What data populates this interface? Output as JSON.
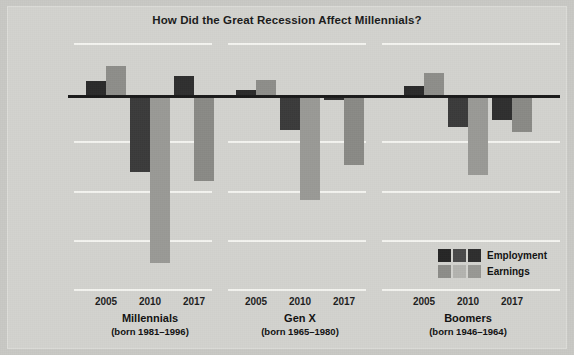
{
  "chart_data": {
    "type": "bar",
    "title": "How Did the Great Recession Affect Millennials?",
    "xlabel": "",
    "ylabel": "Difference from average level",
    "ylim": [
      -20,
      5
    ],
    "yticks": [
      5,
      0,
      -5,
      -10,
      -15,
      -20
    ],
    "ytick_labels": [
      "5%",
      "0",
      "-5%",
      "-10%",
      "-15%",
      "-20%"
    ],
    "grid": true,
    "legend_position": "bottom-right",
    "legend_entries": [
      "Employment",
      "Earnings"
    ],
    "categories": [
      "2005",
      "2010",
      "2017"
    ],
    "groups": [
      {
        "name": "Millennials",
        "subtitle": "(born 1981–1996)",
        "years": [
          "2005",
          "2010",
          "2017"
        ],
        "series": [
          {
            "name": "Employment",
            "values": [
              1.2,
              -8.0,
              1.7
            ]
          },
          {
            "name": "Earnings",
            "values": [
              2.8,
              -17.3,
              -8.9
            ]
          }
        ]
      },
      {
        "name": "Gen X",
        "subtitle": "(born 1965–1980)",
        "years": [
          "2005",
          "2010",
          "2017"
        ],
        "series": [
          {
            "name": "Employment",
            "values": [
              0.3,
              -3.7,
              -0.7
            ]
          },
          {
            "name": "Earnings",
            "values": [
              1.3,
              -10.9,
              -7.3
            ]
          }
        ]
      },
      {
        "name": "Boomers",
        "subtitle": "(born 1946–1964)",
        "years": [
          "2005",
          "2010",
          "2017"
        ],
        "series": [
          {
            "name": "Employment",
            "values": [
              0.7,
              -3.4,
              -2.7
            ]
          },
          {
            "name": "Earnings",
            "values": [
              2.1,
              -8.3,
              -3.9
            ]
          }
        ]
      }
    ],
    "colors": {
      "background": "#d3d3cf",
      "page": "#c9c9c5",
      "gridline": "#f2f2ee",
      "zero_line": "#1a1a1a",
      "employment_2005": "#2b2b2b",
      "employment_2010": "#3b3b3b",
      "employment_2017": "#2f2f2f",
      "earnings_2005": "#8e8e8a",
      "earnings_2010": "#9a9a96",
      "earnings_2017": "#8a8a86",
      "text": "#1b1b1b"
    }
  },
  "legend": {
    "rows": [
      {
        "label": "Employment",
        "swatches": [
          "#262626",
          "#4a4a4a",
          "#2e2e2e"
        ]
      },
      {
        "label": "Earnings",
        "swatches": [
          "#8d8d89",
          "#b4b4b0",
          "#989894"
        ]
      }
    ]
  },
  "axis": {
    "ytick_labels": [
      "5%",
      "0",
      "-5%",
      "-10%",
      "-15%",
      "-20%"
    ],
    "title": "Difference from average level"
  }
}
